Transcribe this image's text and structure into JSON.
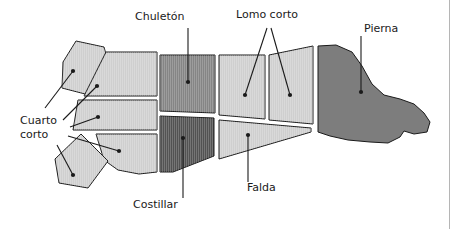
{
  "figure": {
    "background_color": "#ffffff",
    "frame_line_color": "#b5b5b5"
  },
  "palette": {
    "light_gray": "#cfcfcf",
    "medium_gray": "#858585",
    "dark_gray": "#525252",
    "leg_gray": "#7d7d7d",
    "outline": "#1a1a1a",
    "leader_line": "#1a1a1a",
    "text": "#1a1a1a"
  },
  "labels": [
    {
      "id": "chuleton",
      "text": "Chuletón",
      "x": 135,
      "y": 20,
      "anchor": "start",
      "lines": [
        "Chuletón"
      ]
    },
    {
      "id": "lomo-corto",
      "text": "Lomo corto",
      "x": 236,
      "y": 18,
      "anchor": "start",
      "lines": [
        "Lomo corto"
      ]
    },
    {
      "id": "pierna",
      "text": "Pierna",
      "x": 364,
      "y": 32,
      "anchor": "start",
      "lines": [
        "Pierna"
      ]
    },
    {
      "id": "cuarto-corto",
      "text": "Cuarto corto",
      "x": 20,
      "y": 124,
      "anchor": "start",
      "lines": [
        "Cuarto",
        "corto"
      ]
    },
    {
      "id": "costillar",
      "text": "Costillar",
      "x": 133,
      "y": 208,
      "anchor": "start",
      "lines": [
        "Costillar"
      ]
    },
    {
      "id": "falda",
      "text": "Falda",
      "x": 247,
      "y": 191,
      "anchor": "start",
      "lines": [
        "Falda"
      ]
    }
  ],
  "cuts": [
    {
      "id": "cuarto-corto-upper-flank",
      "name": "Cuarto corto (pieza superior separada)",
      "fill": "#cfcfcf",
      "hatched": true,
      "points": "76,41 104,47 111,72 89,95 62,88 63,62"
    },
    {
      "id": "cuarto-corto-upper-band",
      "name": "Cuarto corto (banda superior)",
      "fill": "#cfcfcf",
      "hatched": true,
      "points": "84,96 106,52 157,52 157,96"
    },
    {
      "id": "cuarto-corto-middle-band",
      "name": "Cuarto corto (banda media)",
      "fill": "#cfcfcf",
      "hatched": true,
      "points": "78,100 157,100 157,130 73,130"
    },
    {
      "id": "cuarto-corto-lower-band",
      "name": "Cuarto corto (banda inferior)",
      "fill": "#cfcfcf",
      "hatched": true,
      "points": "96,134 157,134 157,172 139,174 118,170 104,160"
    },
    {
      "id": "cuarto-corto-lower-flank",
      "name": "Cuarto corto (pieza inferior separada)",
      "fill": "#cfcfcf",
      "hatched": true,
      "points": "81,134 108,161 88,188 59,183 55,159"
    },
    {
      "id": "chuleton",
      "name": "Chuletón",
      "fill": "#858585",
      "hatched": true,
      "points": "160,55 215,55 215,113 160,111"
    },
    {
      "id": "costillar",
      "name": "Costillar",
      "fill": "#525252",
      "hatched": true,
      "points": "160,116 214,118 214,156 173,172 160,172"
    },
    {
      "id": "lomo-corto-a",
      "name": "Lomo corto (pieza A)",
      "fill": "#cfcfcf",
      "hatched": true,
      "points": "219,55 265,55 265,119 219,115"
    },
    {
      "id": "lomo-corto-b",
      "name": "Lomo corto (pieza B)",
      "fill": "#cfcfcf",
      "hatched": true,
      "points": "269,55 313,46 313,124 269,120"
    },
    {
      "id": "falda",
      "name": "Falda",
      "fill": "#cfcfcf",
      "hatched": true,
      "points": "219,120 311,128 311,132 219,159"
    },
    {
      "id": "pierna",
      "name": "Pierna",
      "fill": "#7d7d7d",
      "hatched": false,
      "points": "318,46 336,45 352,52 362,66 372,84 384,95 400,99 414,104 424,113 430,122 427,132 414,134 404,131 400,137 388,143 370,142 348,140 330,136 318,132"
    }
  ],
  "leaders": [
    {
      "id": "leader-chuleton",
      "from_label": "chuleton",
      "path": "M 188,28 L 188,82",
      "dot": [
        188,
        82
      ]
    },
    {
      "id": "leader-lomo-corto-a",
      "from_label": "lomo-corto",
      "path": "M 267,28 L 245,95",
      "dot": [
        245,
        95
      ]
    },
    {
      "id": "leader-lomo-corto-b",
      "from_label": "lomo-corto",
      "path": "M 271,28 L 290,95",
      "dot": [
        290,
        95
      ]
    },
    {
      "id": "leader-pierna",
      "from_label": "pierna",
      "path": "M 361,36 L 361,92",
      "dot": [
        361,
        92
      ]
    },
    {
      "id": "leader-cuarto-corto-1",
      "from_label": "cuarto-corto",
      "path": "M 45,108 L 73,71",
      "dot": [
        73,
        71
      ]
    },
    {
      "id": "leader-cuarto-corto-2",
      "from_label": "cuarto-corto",
      "path": "M 63,120 L 97,86",
      "dot": [
        97,
        86
      ]
    },
    {
      "id": "leader-cuarto-corto-3",
      "from_label": "cuarto-corto",
      "path": "M 70,127 L 98,117",
      "dot": [
        98,
        117
      ]
    },
    {
      "id": "leader-cuarto-corto-4",
      "from_label": "cuarto-corto",
      "path": "M 68,136 L 119,151",
      "dot": [
        119,
        151
      ]
    },
    {
      "id": "leader-cuarto-corto-5",
      "from_label": "cuarto-corto",
      "path": "M 57,145 L 73,175",
      "dot": [
        73,
        175
      ]
    },
    {
      "id": "leader-costillar",
      "from_label": "costillar",
      "path": "M 183,198 L 183,138",
      "dot": [
        183,
        138
      ]
    },
    {
      "id": "leader-falda",
      "from_label": "falda",
      "path": "M 248,182 L 248,135",
      "dot": [
        248,
        135
      ]
    }
  ]
}
